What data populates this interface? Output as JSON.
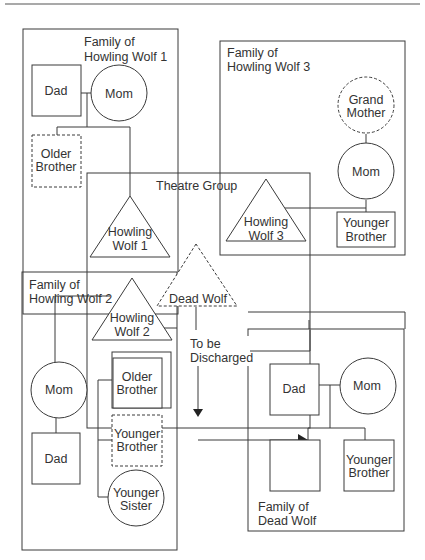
{
  "diagram": {
    "type": "genogram / group membership diagram",
    "groups": {
      "family_hw1": {
        "label_line1": "Family of",
        "label_line2": "Howling Wolf 1"
      },
      "family_hw3": {
        "label_line1": "Family of",
        "label_line2": "Howling Wolf 3"
      },
      "family_hw2": {
        "label_line1": "Family of",
        "label_line2": "Howling Wolf 2"
      },
      "family_dead": {
        "label_line1": "Family of",
        "label_line2": "Dead Wolf"
      },
      "theatre": {
        "label": "Theatre Group"
      }
    },
    "nodes": {
      "hw1_dad": {
        "label": "Dad",
        "shape": "square"
      },
      "hw1_mom": {
        "label": "Mom",
        "shape": "circle"
      },
      "hw1_older_brother": {
        "line1": "Older",
        "line2": "Brother",
        "shape": "square-dashed"
      },
      "hw1": {
        "line1": "Howling",
        "line2": "Wolf 1",
        "shape": "triangle"
      },
      "hw3_grandmother": {
        "line1": "Grand",
        "line2": "Mother",
        "shape": "circle-dashed"
      },
      "hw3_mom": {
        "label": "Mom",
        "shape": "circle"
      },
      "hw3_younger_brother": {
        "line1": "Younger",
        "line2": "Brother",
        "shape": "square"
      },
      "hw3": {
        "line1": "Howling",
        "line2": "Wolf 3",
        "shape": "triangle"
      },
      "dead_wolf": {
        "label": "Dead Wolf",
        "shape": "triangle-dashed"
      },
      "hw2": {
        "line1": "Howling",
        "line2": "Wolf 2",
        "shape": "triangle"
      },
      "hw2_mom": {
        "label": "Mom",
        "shape": "circle"
      },
      "hw2_dad": {
        "label": "Dad",
        "shape": "square"
      },
      "hw2_older_brother": {
        "line1": "Older",
        "line2": "Brother",
        "shape": "square-double"
      },
      "hw2_younger_brother": {
        "line1": "Younger",
        "line2": "Brother",
        "shape": "square-dashed"
      },
      "hw2_younger_sister": {
        "line1": "Younger",
        "line2": "Sister",
        "shape": "circle"
      },
      "dw_dad": {
        "label": "Dad",
        "shape": "square"
      },
      "dw_mom": {
        "label": "Mom",
        "shape": "circle"
      },
      "dw_self": {
        "label": "",
        "shape": "square-empty"
      },
      "dw_younger_brother": {
        "line1": "Younger",
        "line2": "Brother",
        "shape": "square"
      }
    },
    "annotations": {
      "discharge_line1": "To be",
      "discharge_line2": "Discharged"
    }
  }
}
